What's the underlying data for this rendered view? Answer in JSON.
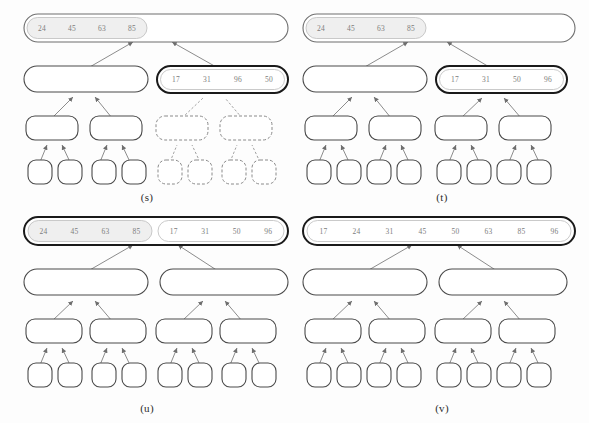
{
  "figure": {
    "background_color": "#fdfdfd",
    "stroke_color": "#6e6e6e",
    "highlight_stroke_color": "#1a1a1a",
    "fill_color": "#ffffff",
    "shaded_fill_color": "#efefef",
    "text_color": "#7d7d7d"
  },
  "panels": [
    {
      "id": "s",
      "caption": "(s)",
      "root": {
        "values": [
          "24",
          "45",
          "63",
          "85"
        ],
        "highlighted": false,
        "shaded": true,
        "dashed": false
      },
      "right_node": {
        "values": [
          "17",
          "31",
          "96",
          "50"
        ],
        "highlighted": true,
        "shaded": false,
        "dashed": false
      },
      "left_subtree_style": "solid",
      "right_subtree_style": "dashed"
    },
    {
      "id": "t",
      "caption": "(t)",
      "root": {
        "values": [
          "24",
          "45",
          "63",
          "85"
        ],
        "highlighted": false,
        "shaded": true,
        "dashed": false
      },
      "right_node": {
        "values": [
          "17",
          "31",
          "50",
          "96"
        ],
        "highlighted": true,
        "shaded": false,
        "dashed": false
      },
      "left_subtree_style": "solid",
      "right_subtree_style": "solid"
    },
    {
      "id": "u",
      "caption": "(u)",
      "root_highlighted": true,
      "root_sections": [
        {
          "values": [
            "24",
            "45",
            "63",
            "85"
          ],
          "shaded": true
        },
        {
          "values": [
            "17",
            "31",
            "50",
            "96"
          ],
          "shaded": false
        }
      ],
      "left_subtree_style": "solid",
      "right_subtree_style": "solid"
    },
    {
      "id": "v",
      "caption": "(v)",
      "root_highlighted": true,
      "root_sections": [
        {
          "values": [
            "17",
            "24",
            "31",
            "45",
            "50",
            "63",
            "85",
            "96"
          ],
          "shaded": false
        }
      ],
      "left_subtree_style": "solid",
      "right_subtree_style": "solid"
    }
  ]
}
